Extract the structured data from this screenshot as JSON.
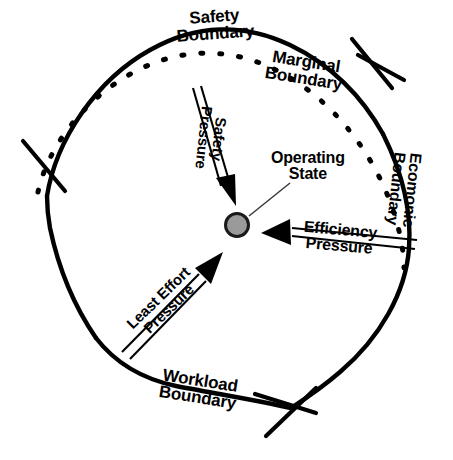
{
  "diagram": {
    "background_color": "#ffffff",
    "line_color": "#000000",
    "operating_state": {
      "label_line1": "Operating",
      "label_line2": "State",
      "fill_color": "#9a9a9a",
      "stroke_color": "#1a1a1a",
      "center_x": 237,
      "center_y": 225,
      "radius": 13
    },
    "boundaries": [
      {
        "id": "safety",
        "label_line1": "Safety",
        "label_line2": "Boundary",
        "style": "solid",
        "position": "top"
      },
      {
        "id": "marginal",
        "label_line1": "Marginal",
        "label_line2": "Boundary",
        "style": "dashed",
        "position": "inner-top"
      },
      {
        "id": "economic",
        "label_line1": "Ecomonic",
        "label_line2": "Boundary",
        "style": "solid",
        "position": "right"
      },
      {
        "id": "workload",
        "label_line1": "Workload",
        "label_line2": "Boundary",
        "style": "solid",
        "position": "bottom"
      }
    ],
    "pressures": [
      {
        "id": "safety-pressure",
        "label_line1": "Safety",
        "label_line2": "Pressure",
        "direction": "down-right",
        "arrow_style": "double-line"
      },
      {
        "id": "efficiency-pressure",
        "label_line1": "Efficiency",
        "label_line2": "Pressure",
        "direction": "left",
        "arrow_style": "double-line"
      },
      {
        "id": "least-effort-pressure",
        "label_line1": "Least Effort",
        "label_line2": "Pressure",
        "direction": "up-right",
        "arrow_style": "double-line"
      }
    ]
  }
}
